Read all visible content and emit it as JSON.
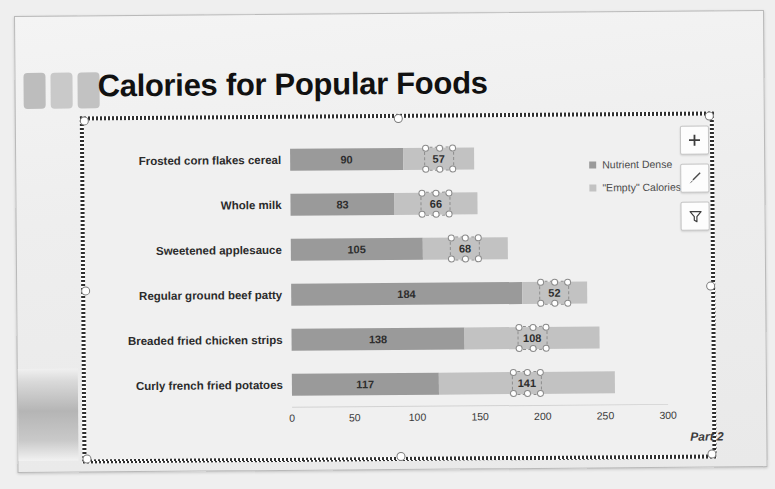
{
  "slide": {
    "title": "Calories for Popular Foods",
    "footer_note": "Part 2"
  },
  "chart_tools": [
    {
      "name": "chart-elements-button",
      "icon": "plus-icon",
      "label": "+"
    },
    {
      "name": "chart-styles-button",
      "icon": "brush-icon",
      "label": ""
    },
    {
      "name": "chart-filters-button",
      "icon": "funnel-icon",
      "label": ""
    }
  ],
  "chart_data": {
    "type": "bar",
    "orientation": "horizontal",
    "stacked": true,
    "title": "Calories for Popular Foods",
    "xlabel": "",
    "ylabel": "",
    "xlim": [
      0,
      300
    ],
    "xticks": [
      0,
      50,
      100,
      150,
      200,
      250,
      300
    ],
    "grid": false,
    "legend_position": "right-top",
    "categories": [
      "Frosted corn flakes cereal",
      "Whole milk",
      "Sweetened applesauce",
      "Regular ground beef patty",
      "Breaded fried chicken strips",
      "Curly french fried potatoes"
    ],
    "series": [
      {
        "name": "Nutrient Dense",
        "color": "#9a9a9a",
        "values": [
          90,
          83,
          105,
          184,
          138,
          117
        ]
      },
      {
        "name": "\"Empty\" Calories",
        "color": "#c2c2c2",
        "values": [
          57,
          66,
          68,
          52,
          108,
          141
        ],
        "labels_selected": true
      }
    ],
    "totals": [
      147,
      149,
      173,
      236,
      246,
      258
    ]
  }
}
